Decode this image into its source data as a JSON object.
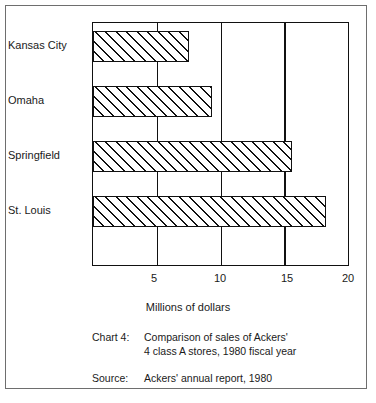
{
  "chart_data": {
    "type": "bar",
    "orientation": "horizontal",
    "title": "",
    "categories": [
      "Kansas City",
      "Omaha",
      "Springfield",
      "St. Louis"
    ],
    "values": [
      7.5,
      9.3,
      15.6,
      18.3
    ],
    "series": [
      {
        "name": "1980 sales",
        "values": [
          7.5,
          9.3,
          15.6,
          18.3
        ]
      }
    ],
    "xlabel": "Millions of dollars",
    "ylabel": "",
    "xlim": [
      0,
      20
    ],
    "ylim": null,
    "xticks": [
      5,
      10,
      15,
      20
    ],
    "xtick_labels": [
      "5",
      "10",
      "15",
      "20"
    ],
    "grid": "vertical-only",
    "legend": null,
    "bar_fill": "diagonal-hatch",
    "annotations": [
      "Chart 4:  Comparison of sales of Ackers' 4 class A stores, 1980 fiscal year",
      "Source:  Ackers' annual report, 1980"
    ]
  },
  "axis": {
    "x_title": "Millions of dollars",
    "tick_labels": [
      "5",
      "10",
      "15",
      "20"
    ]
  },
  "categories": [
    {
      "label": "Kansas City"
    },
    {
      "label": "Omaha"
    },
    {
      "label": "Springfield"
    },
    {
      "label": "St. Louis"
    }
  ],
  "caption": {
    "chart_key": "Chart 4:",
    "chart_line1": "Comparison of sales of Ackers'",
    "chart_line2": "4 class A stores, 1980 fiscal year",
    "source_key": "Source:",
    "source_line1": "Ackers' annual report, 1980"
  },
  "colors": {
    "ink": "#111111",
    "frame": "#6e6e6e",
    "paper": "#ffffff"
  }
}
